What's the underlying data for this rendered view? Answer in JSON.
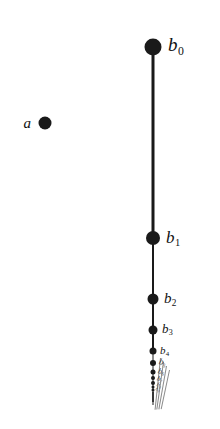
{
  "figure": {
    "background_color": "#ffffff",
    "ink_color": "#1a1a1a",
    "faint_ink_color": "#8a8a8a",
    "isolated_point": {
      "label_letter": "a",
      "label": "a",
      "cx": 45,
      "cy": 123,
      "diameter": 13,
      "label_x": 31,
      "label_y": 123,
      "font_size": 15
    },
    "sequence_letter": "b",
    "points": [
      {
        "name": "b0",
        "letter": "b",
        "subscript": "0",
        "cx": 153,
        "cy": 47,
        "diameter": 17,
        "label_x": 168,
        "label_y": 44,
        "font_size": 19
      },
      {
        "name": "b1",
        "letter": "b",
        "subscript": "1",
        "cx": 153,
        "cy": 238,
        "diameter": 14,
        "label_x": 166,
        "label_y": 237,
        "font_size": 17
      },
      {
        "name": "b2",
        "letter": "b",
        "subscript": "2",
        "cx": 153,
        "cy": 299,
        "diameter": 11,
        "label_x": 164,
        "label_y": 298,
        "font_size": 15
      },
      {
        "name": "b3",
        "letter": "b",
        "subscript": "3",
        "cx": 153,
        "cy": 330,
        "diameter": 9,
        "label_x": 162,
        "label_y": 329,
        "font_size": 13
      },
      {
        "name": "b4",
        "letter": "b",
        "subscript": "4",
        "cx": 153,
        "cy": 351,
        "diameter": 7,
        "label_x": 160,
        "label_y": 350,
        "font_size": 11
      },
      {
        "name": "b5",
        "letter": "b",
        "subscript": "5",
        "cx": 153,
        "cy": 363,
        "diameter": 6,
        "label_x": 159,
        "label_y": 362,
        "font_size": 9
      },
      {
        "name": "b6",
        "letter": "b",
        "subscript": "6",
        "cx": 153,
        "cy": 372,
        "diameter": 5,
        "label_x": 158,
        "label_y": 371,
        "font_size": 8
      },
      {
        "name": "b7",
        "letter": "b",
        "subscript": "7",
        "cx": 153,
        "cy": 378,
        "diameter": 4,
        "label_x": 157,
        "label_y": 378,
        "font_size": 7
      },
      {
        "name": "b8",
        "letter": "b",
        "subscript": "8",
        "cx": 153,
        "cy": 383,
        "diameter": 4,
        "label_x": 157,
        "label_y": 383,
        "font_size": 6
      },
      {
        "name": "b9",
        "letter": "b",
        "subscript": "9",
        "cx": 153,
        "cy": 387,
        "diameter": 3,
        "label_x": 156,
        "label_y": 387,
        "font_size": 5
      },
      {
        "name": "b10",
        "letter": "b",
        "subscript": "10",
        "cx": 153,
        "cy": 390,
        "diameter": 3,
        "label_x": 156,
        "label_y": 390,
        "font_size": 5
      },
      {
        "name": "b11",
        "letter": "b",
        "subscript": "11",
        "cx": 153,
        "cy": 393,
        "diameter": 2,
        "label_x": 156,
        "label_y": 393,
        "font_size": 4
      },
      {
        "name": "b12",
        "letter": "b",
        "subscript": "12",
        "cx": 153,
        "cy": 395,
        "diameter": 2,
        "label_x": 156,
        "label_y": 395,
        "font_size": 4
      },
      {
        "name": "b13",
        "letter": "b",
        "subscript": "13",
        "cx": 153,
        "cy": 397,
        "diameter": 2,
        "label_x": 156,
        "label_y": 397,
        "font_size": 4
      },
      {
        "name": "b14",
        "letter": "b",
        "subscript": "14",
        "cx": 153,
        "cy": 399,
        "diameter": 2,
        "label_x": 156,
        "label_y": 399,
        "font_size": 4
      },
      {
        "name": "b15",
        "letter": "b",
        "subscript": "15",
        "cx": 153,
        "cy": 401,
        "diameter": 2,
        "label_x": 156,
        "label_y": 401,
        "font_size": 4
      }
    ],
    "segments": [
      {
        "name": "b0-b1",
        "cx": 153,
        "top": 47,
        "height": 191,
        "width": 3
      },
      {
        "name": "b1-b2",
        "cx": 153,
        "top": 238,
        "height": 61,
        "width": 2
      },
      {
        "name": "b2-b3",
        "cx": 153,
        "top": 299,
        "height": 31,
        "width": 2
      },
      {
        "name": "b3-b4",
        "cx": 153,
        "top": 330,
        "height": 21,
        "width": 2
      },
      {
        "name": "b4-b5",
        "cx": 153,
        "top": 351,
        "height": 12,
        "width": 1
      },
      {
        "name": "b5-tail",
        "cx": 153,
        "top": 363,
        "height": 42,
        "width": 1
      }
    ],
    "tail_streaks": [
      {
        "name": "streak-1",
        "x": 160,
        "top": 358,
        "height": 52,
        "width": 1,
        "angle": 6
      },
      {
        "name": "streak-2",
        "x": 163,
        "top": 362,
        "height": 48,
        "width": 1,
        "angle": 8
      },
      {
        "name": "streak-3",
        "x": 166,
        "top": 366,
        "height": 44,
        "width": 1,
        "angle": 10
      },
      {
        "name": "streak-4",
        "x": 169,
        "top": 370,
        "height": 40,
        "width": 1,
        "angle": 12
      }
    ]
  }
}
